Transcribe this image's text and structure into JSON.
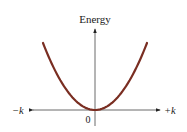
{
  "chart_data": {
    "type": "line",
    "title": "",
    "ylabel": "Energy",
    "xlabel_left": "−k",
    "xlabel_right": "+k",
    "origin_label": "0",
    "series": [
      {
        "name": "E(k) parabola",
        "color": "#7a2e22",
        "x": [
          -1,
          -0.75,
          -0.5,
          -0.25,
          0,
          0.25,
          0.5,
          0.75,
          1
        ],
        "values": [
          1,
          0.5625,
          0.25,
          0.0625,
          0,
          0.0625,
          0.25,
          0.5625,
          1
        ]
      }
    ],
    "grid": false,
    "legend": "none",
    "axis_color": "#333333"
  }
}
